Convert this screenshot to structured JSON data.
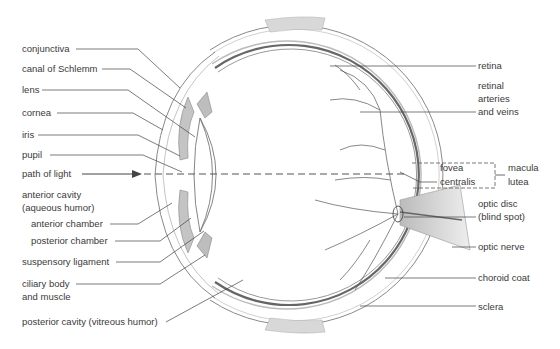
{
  "diagram": {
    "left_labels": [
      {
        "id": "conjunctiva",
        "text": "conjunctiva",
        "x": 22,
        "y": 43
      },
      {
        "id": "canal-of-schlemm",
        "text": "canal of Schlemm",
        "x": 22,
        "y": 62
      },
      {
        "id": "lens",
        "text": "lens",
        "x": 22,
        "y": 84
      },
      {
        "id": "cornea",
        "text": "cornea",
        "x": 22,
        "y": 107
      },
      {
        "id": "iris",
        "text": "iris",
        "x": 22,
        "y": 129
      },
      {
        "id": "pupil",
        "text": "pupil",
        "x": 22,
        "y": 149
      },
      {
        "id": "path-of-light",
        "text": "path of light",
        "x": 22,
        "y": 168
      },
      {
        "id": "anterior-cavity-1",
        "text": "anterior cavity",
        "x": 22,
        "y": 189
      },
      {
        "id": "anterior-cavity-2",
        "text": "(aqueous humor)",
        "x": 22,
        "y": 202
      },
      {
        "id": "anterior-chamber",
        "text": "anterior chamber",
        "x": 31,
        "y": 218
      },
      {
        "id": "posterior-chamber",
        "text": "posterior chamber",
        "x": 31,
        "y": 234
      },
      {
        "id": "suspensory-ligament",
        "text": "suspensory ligament",
        "x": 22,
        "y": 255
      },
      {
        "id": "ciliary-body-1",
        "text": "ciliary body",
        "x": 22,
        "y": 278
      },
      {
        "id": "ciliary-body-2",
        "text": "and muscle",
        "x": 22,
        "y": 291
      },
      {
        "id": "posterior-cavity",
        "text": "posterior cavity (vitreous humor)",
        "x": 22,
        "y": 316
      }
    ],
    "right_labels": [
      {
        "id": "retina",
        "text": "retina",
        "x": 478,
        "y": 60
      },
      {
        "id": "retinal-1",
        "text": "retinal",
        "x": 478,
        "y": 80
      },
      {
        "id": "retinal-2",
        "text": "arteries",
        "x": 478,
        "y": 93
      },
      {
        "id": "retinal-3",
        "text": "and veins",
        "x": 478,
        "y": 106
      },
      {
        "id": "fovea-1",
        "text": "fovea",
        "x": 440,
        "y": 162
      },
      {
        "id": "fovea-2",
        "text": "centralis",
        "x": 440,
        "y": 176
      },
      {
        "id": "macula-1",
        "text": "macula",
        "x": 508,
        "y": 162
      },
      {
        "id": "macula-2",
        "text": "lutea",
        "x": 508,
        "y": 176
      },
      {
        "id": "optic-disc-1",
        "text": "optic disc",
        "x": 478,
        "y": 198
      },
      {
        "id": "optic-disc-2",
        "text": "(blind spot)",
        "x": 478,
        "y": 211
      },
      {
        "id": "optic-nerve",
        "text": "optic nerve",
        "x": 478,
        "y": 241
      },
      {
        "id": "choroid-coat",
        "text": "choroid coat",
        "x": 478,
        "y": 272
      },
      {
        "id": "sclera",
        "text": "sclera",
        "x": 478,
        "y": 301
      }
    ],
    "colors": {
      "label_text": "#3a3a3a",
      "leader_line": "#444444",
      "outline": "#888888",
      "vessel": "#555555"
    }
  }
}
